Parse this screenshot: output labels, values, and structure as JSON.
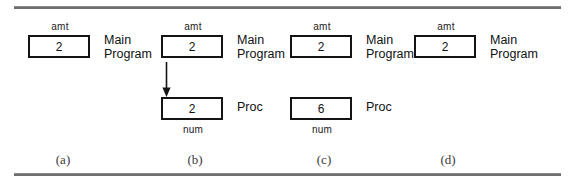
{
  "figure": {
    "caption_font_note": "",
    "panels": [
      {
        "id": "a",
        "subcaption": "(a)",
        "frames": [
          {
            "var_label": "amt",
            "var_label_position": "above",
            "value": "2",
            "side_label": "Main\nProgram"
          }
        ],
        "arrow": false
      },
      {
        "id": "b",
        "subcaption": "(b)",
        "frames": [
          {
            "var_label": "amt",
            "var_label_position": "above",
            "value": "2",
            "side_label": "Main\nProgram"
          },
          {
            "var_label": "num",
            "var_label_position": "below",
            "value": "2",
            "side_label": "Proc"
          }
        ],
        "arrow": true
      },
      {
        "id": "c",
        "subcaption": "(c)",
        "frames": [
          {
            "var_label": "amt",
            "var_label_position": "above",
            "value": "2",
            "side_label": "Main\nProgram"
          },
          {
            "var_label": "num",
            "var_label_position": "below",
            "value": "6",
            "side_label": "Proc"
          }
        ],
        "arrow": false
      },
      {
        "id": "d",
        "subcaption": "(d)",
        "frames": [
          {
            "var_label": "amt",
            "var_label_position": "above",
            "value": "2",
            "side_label": "Main\nProgram"
          }
        ],
        "arrow": false
      }
    ]
  },
  "colors": {
    "box_border": "#141414",
    "rule": "#6e6e6e",
    "text": "#111111",
    "subcaption": "#3a3a3a",
    "background": "#ffffff"
  }
}
